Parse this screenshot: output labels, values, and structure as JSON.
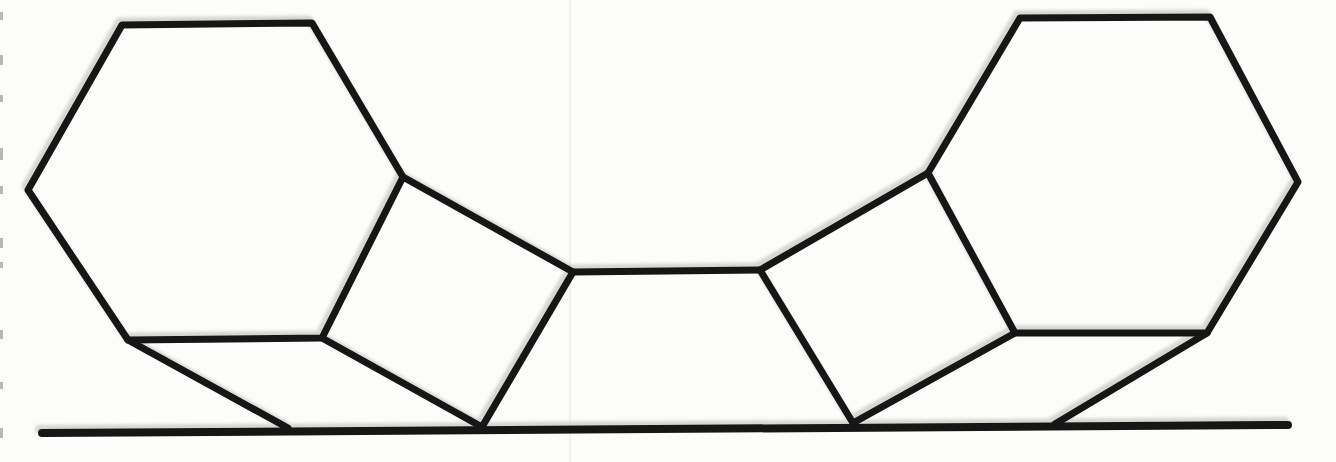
{
  "canvas": {
    "width": 1336,
    "height": 462,
    "background": "#fcfcfa"
  },
  "figure": {
    "figure_type": "geometric line drawing (scanned)",
    "ink_color": "#161616",
    "ghost_color": "#cfccc6",
    "ghost_offset": {
      "dx": -3,
      "dy": -4
    },
    "crease": {
      "x": 569,
      "width": 2,
      "color": "#f1f0ec"
    },
    "stroke_width_default": 7,
    "shapes": [
      {
        "name": "ground-line",
        "closed": false,
        "width": 8,
        "points": [
          [
            42,
            433
          ],
          [
            1288,
            425
          ]
        ]
      },
      {
        "name": "left-hexagon",
        "closed": true,
        "width": 7,
        "points": [
          [
            122,
            25
          ],
          [
            312,
            23
          ],
          [
            403,
            177
          ],
          [
            322,
            338
          ],
          [
            128,
            340
          ],
          [
            28,
            190
          ]
        ]
      },
      {
        "name": "left-square",
        "closed": false,
        "width": 7,
        "points": [
          [
            403,
            177
          ],
          [
            573,
            272
          ],
          [
            482,
            427
          ],
          [
            322,
            338
          ]
        ]
      },
      {
        "name": "left-strut",
        "closed": false,
        "width": 7,
        "points": [
          [
            128,
            340
          ],
          [
            288,
            428
          ]
        ]
      },
      {
        "name": "center-bar",
        "closed": false,
        "width": 7,
        "points": [
          [
            573,
            272
          ],
          [
            760,
            270
          ]
        ]
      },
      {
        "name": "right-square",
        "closed": false,
        "width": 7,
        "points": [
          [
            928,
            173
          ],
          [
            760,
            270
          ],
          [
            853,
            423
          ],
          [
            1015,
            333
          ]
        ]
      },
      {
        "name": "right-hexagon",
        "closed": true,
        "width": 7,
        "points": [
          [
            1020,
            18
          ],
          [
            1210,
            17
          ],
          [
            1298,
            182
          ],
          [
            1207,
            333
          ],
          [
            1015,
            333
          ],
          [
            928,
            173
          ]
        ]
      },
      {
        "name": "right-strut",
        "closed": false,
        "width": 7,
        "points": [
          [
            1207,
            333
          ],
          [
            1055,
            424
          ]
        ]
      }
    ],
    "edge_marks": [
      {
        "y": 12,
        "h": 8
      },
      {
        "y": 55,
        "h": 10
      },
      {
        "y": 95,
        "h": 7
      },
      {
        "y": 148,
        "h": 12
      },
      {
        "y": 186,
        "h": 8
      },
      {
        "y": 238,
        "h": 10
      },
      {
        "y": 262,
        "h": 6
      },
      {
        "y": 330,
        "h": 9
      },
      {
        "y": 382,
        "h": 7
      },
      {
        "y": 428,
        "h": 10
      }
    ],
    "edge_mark_color": "#808078"
  }
}
